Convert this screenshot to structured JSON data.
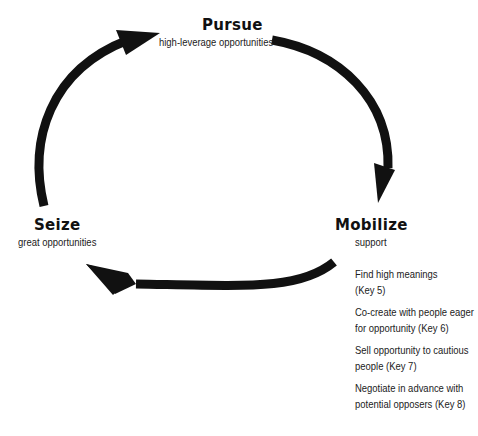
{
  "diagram": {
    "type": "cycle",
    "nodes": {
      "pursue": {
        "title": "Pursue",
        "subtitle": "high-leverage opportunities"
      },
      "mobilize": {
        "title": "Mobilize",
        "subtitle": "support",
        "steps": [
          "Find high meanings\n(Key 5)",
          "Co-create with people eager\nfor opportunity (Key 6)",
          "Sell opportunity to cautious\npeople (Key 7)",
          "Negotiate in advance with\npotential opposers (Key 8)"
        ]
      },
      "seize": {
        "title": "Seize",
        "subtitle": "great opportunities"
      }
    },
    "edges": [
      {
        "from": "seize",
        "to": "pursue"
      },
      {
        "from": "pursue",
        "to": "mobilize"
      },
      {
        "from": "mobilize",
        "to": "seize"
      }
    ],
    "colors": {
      "arrow": "#111111",
      "text": "#222222",
      "background": "#ffffff"
    }
  }
}
